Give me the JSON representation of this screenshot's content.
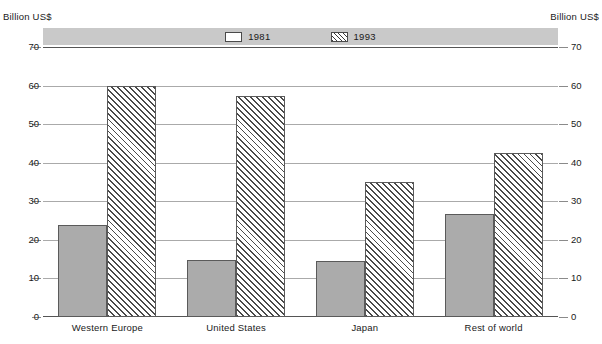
{
  "axis_unit_left": "Billion US$",
  "axis_unit_right": "Billion US$",
  "legend": {
    "entries": [
      {
        "label": "1981",
        "swatch": "solid-box-icon"
      },
      {
        "label": "1993",
        "swatch": "hatched-box-icon"
      }
    ]
  },
  "ytick_labels": [
    "0",
    "10",
    "20",
    "30",
    "40",
    "50",
    "60",
    "70"
  ],
  "chart_data": {
    "type": "bar",
    "title": "",
    "subtitle": "",
    "xlabel": "",
    "ylabel": "Billion US$",
    "ylim": [
      0,
      70
    ],
    "yticks": [
      0,
      10,
      20,
      30,
      40,
      50,
      60,
      70
    ],
    "grid": true,
    "legend_position": "top",
    "categories": [
      "Western Europe",
      "United States",
      "Japan",
      "Rest of world"
    ],
    "series": [
      {
        "name": "1981",
        "values": [
          23.8,
          14.7,
          14.6,
          26.6
        ]
      },
      {
        "name": "1993",
        "values": [
          59.8,
          57.2,
          35.0,
          42.5
        ]
      }
    ]
  }
}
